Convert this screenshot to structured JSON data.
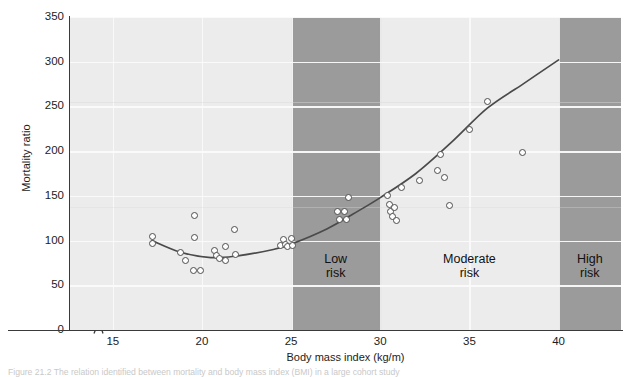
{
  "figure": {
    "caption": "Figure 21.2   The relation identified between mortality and body mass index (BMI) in a large cohort study"
  },
  "chart_data": {
    "type": "scatter",
    "title": "",
    "xlabel": "Body mass index (kg/m)",
    "ylabel": "Mortality ratio",
    "xlim": [
      12.6,
      43.5
    ],
    "ylim": [
      0,
      350
    ],
    "xticks": [
      15,
      20,
      25,
      30,
      35,
      40
    ],
    "yticks": [
      0,
      50,
      100,
      150,
      200,
      250,
      300,
      350
    ],
    "grid": true,
    "legend": "none",
    "axis_break_x": true,
    "points": [
      {
        "x": 17.2,
        "y": 104
      },
      {
        "x": 17.2,
        "y": 97
      },
      {
        "x": 18.8,
        "y": 87
      },
      {
        "x": 19.1,
        "y": 78
      },
      {
        "x": 19.6,
        "y": 128
      },
      {
        "x": 19.6,
        "y": 103
      },
      {
        "x": 19.5,
        "y": 67
      },
      {
        "x": 19.9,
        "y": 67
      },
      {
        "x": 20.7,
        "y": 89
      },
      {
        "x": 20.8,
        "y": 83
      },
      {
        "x": 21.0,
        "y": 80
      },
      {
        "x": 21.3,
        "y": 93
      },
      {
        "x": 21.3,
        "y": 78
      },
      {
        "x": 21.8,
        "y": 112
      },
      {
        "x": 21.9,
        "y": 84
      },
      {
        "x": 24.4,
        "y": 95
      },
      {
        "x": 24.6,
        "y": 101
      },
      {
        "x": 24.7,
        "y": 96
      },
      {
        "x": 24.8,
        "y": 93
      },
      {
        "x": 25.0,
        "y": 102
      },
      {
        "x": 25.1,
        "y": 95
      },
      {
        "x": 27.6,
        "y": 133
      },
      {
        "x": 27.7,
        "y": 124
      },
      {
        "x": 28.0,
        "y": 133
      },
      {
        "x": 28.1,
        "y": 124
      },
      {
        "x": 28.2,
        "y": 148
      },
      {
        "x": 30.4,
        "y": 150
      },
      {
        "x": 30.5,
        "y": 140
      },
      {
        "x": 30.6,
        "y": 133
      },
      {
        "x": 30.7,
        "y": 127
      },
      {
        "x": 30.8,
        "y": 137
      },
      {
        "x": 30.9,
        "y": 122
      },
      {
        "x": 31.2,
        "y": 159
      },
      {
        "x": 32.2,
        "y": 167
      },
      {
        "x": 33.2,
        "y": 178
      },
      {
        "x": 33.4,
        "y": 196
      },
      {
        "x": 33.6,
        "y": 170
      },
      {
        "x": 33.9,
        "y": 139
      },
      {
        "x": 35.0,
        "y": 224
      },
      {
        "x": 36.0,
        "y": 256
      },
      {
        "x": 38.0,
        "y": 199
      }
    ],
    "fit_curve": {
      "description": "J-shaped fitted mortality curve",
      "points": [
        {
          "x": 17.2,
          "y": 100
        },
        {
          "x": 18.8,
          "y": 87
        },
        {
          "x": 20.5,
          "y": 81
        },
        {
          "x": 22.0,
          "y": 83
        },
        {
          "x": 24.0,
          "y": 90
        },
        {
          "x": 25.0,
          "y": 96
        },
        {
          "x": 27.0,
          "y": 113
        },
        {
          "x": 28.5,
          "y": 130
        },
        {
          "x": 30.0,
          "y": 148
        },
        {
          "x": 32.0,
          "y": 175
        },
        {
          "x": 34.0,
          "y": 210
        },
        {
          "x": 36.0,
          "y": 248
        },
        {
          "x": 38.0,
          "y": 275
        },
        {
          "x": 40.0,
          "y": 302
        }
      ]
    },
    "bands": [
      {
        "name": "low-risk",
        "label_line1": "Low",
        "label_line2": "risk",
        "x_start": 25,
        "x_end": 30,
        "shaded": true
      },
      {
        "name": "moderate-risk",
        "label_line1": "Moderate",
        "label_line2": "risk",
        "x_start": 30,
        "x_end": 40,
        "shaded": false
      },
      {
        "name": "high-risk",
        "label_line1": "High",
        "label_line2": "risk",
        "x_start": 40,
        "x_end": 43.5,
        "shaded": true
      }
    ],
    "colors": {
      "plot_background": "#ececec",
      "band_shaded": "#9b9b9b",
      "gridline": "#fbfbfb",
      "axis": "#3a3a3a",
      "curve": "#4a4a4a",
      "marker_fill": "#fdfdfd",
      "marker_edge": "#4d4d4d"
    }
  }
}
